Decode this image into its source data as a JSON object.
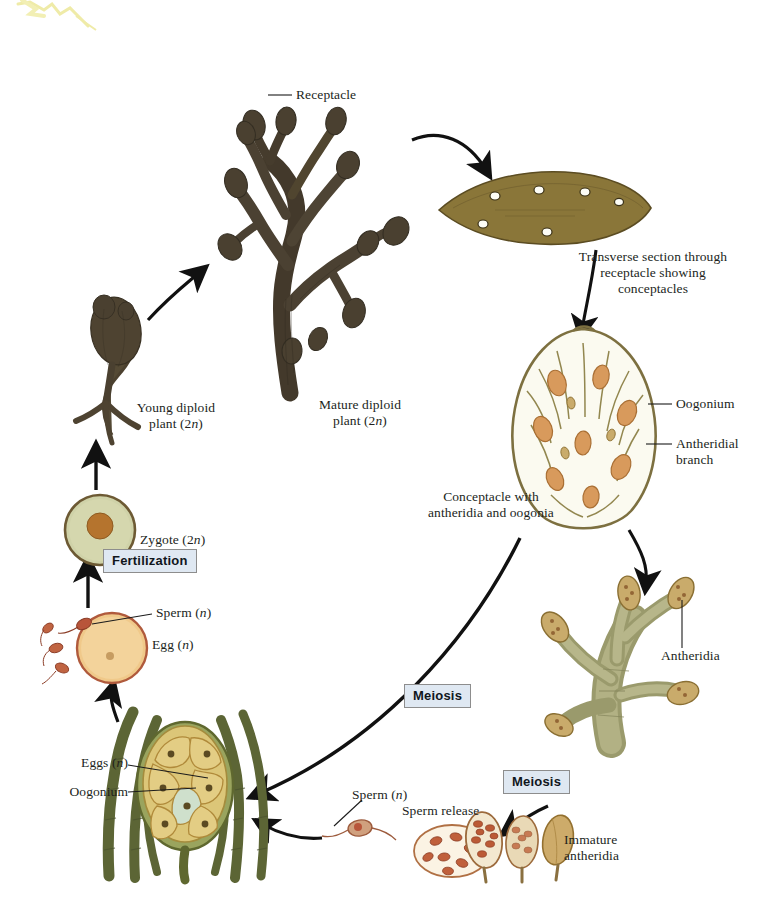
{
  "figure": {
    "organism": "Fucus",
    "background_color": "#ffffff"
  },
  "labels": {
    "receptacle": "Receptacle",
    "transverse_section": "Transverse section through\nreceptacle showing\nconceptacles",
    "oogonium_right": "Oogonium",
    "antheridial_branch": "Antheridial\nbranch",
    "conceptacle": "Conceptacle with\nantheridia and oogonia",
    "young_diploid_plant": "Young diploid\nplant (2n)",
    "mature_diploid_plant": "Mature diploid\nplant (2n)",
    "zygote": "Zygote (2n)",
    "sperm_upper": "Sperm (n)",
    "egg": "Egg (n)",
    "eggs_bottom": "Eggs (n)",
    "oogonium_bottom": "Oogonium",
    "sperm_bottom": "Sperm (n)",
    "sperm_release": "Sperm release",
    "immature_antheridia": "Immature\nantheridia",
    "antheridia_right": "Antheridia"
  },
  "process_boxes": {
    "fertilization": "Fertilization",
    "meiosis_middle": "Meiosis",
    "meiosis_bottom": "Meiosis"
  },
  "ploidy_notation": {
    "diploid": "2n",
    "haploid": "n"
  },
  "colors": {
    "process_box_fill": "#dfe8f2",
    "process_box_border": "#8d8d8d",
    "leader_line": "#1b1b1b",
    "arrow": "#111111",
    "thallus_dark_brown": "#4a3f2c",
    "thallus_mid_brown": "#6b5a3d",
    "receptacle_section_fill": "#8a7639",
    "conceptacle_wall": "#8d8147",
    "filament_green": "#9aa06a",
    "oogonium_orange": "#d89a5c",
    "egg_yellow": "#f0c98a",
    "zygote_fill": "#cfd2a8",
    "zygote_nucleus": "#b5742e",
    "antheridia_tan": "#c9ab6b",
    "sperm_red": "#b8553a",
    "artifact_yellow": "#efeba8"
  },
  "icons": {
    "arrow": "arrow-icon",
    "leader": "leader-line-icon"
  }
}
